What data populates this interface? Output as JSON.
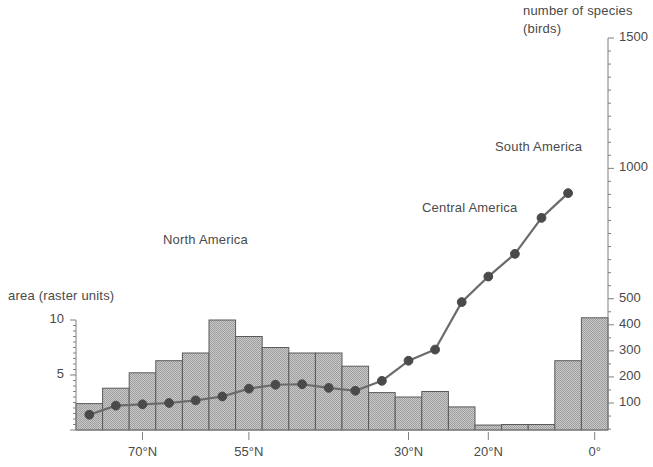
{
  "chart_data": {
    "type": "bar",
    "title": "",
    "subtitle": "",
    "xlabel": "",
    "ylabel": "area (raster units)",
    "y2label": "number of species (birds)",
    "grid": false,
    "legend_position": "inline-annotations",
    "x_tick_labels": [
      "70°N",
      "55°N",
      "30°N",
      "20°N",
      "0°"
    ],
    "x_tick_bins": [
      2,
      6,
      12,
      15,
      19
    ],
    "ylim": [
      0,
      11
    ],
    "y_ticks": [
      5,
      10
    ],
    "y2lim": [
      0,
      1500
    ],
    "y2_ticks": [
      100,
      200,
      300,
      400,
      500,
      1000,
      1500
    ],
    "categories": [
      "bin1",
      "bin2",
      "bin3",
      "bin4",
      "bin5",
      "bin6",
      "bin7",
      "bin8",
      "bin9",
      "bin10",
      "bin11",
      "bin12",
      "bin13",
      "bin14",
      "bin15",
      "bin16",
      "bin17",
      "bin18",
      "bin19",
      "bin20"
    ],
    "series": [
      {
        "name": "area (raster units)",
        "type": "bar",
        "axis": "left",
        "values": [
          2.4,
          3.8,
          5.2,
          6.3,
          7.0,
          10.0,
          8.5,
          7.5,
          7.0,
          7.0,
          5.8,
          3.4,
          3.0,
          3.5,
          2.1,
          0.45,
          0.5,
          0.5,
          6.3,
          10.2
        ]
      },
      {
        "name": "number of species (birds)",
        "type": "line",
        "axis": "right",
        "values": [
          55,
          90,
          95,
          100,
          110,
          125,
          155,
          170,
          172,
          158,
          147,
          185,
          262,
          305,
          487,
          585,
          672,
          810,
          905,
          null
        ]
      }
    ],
    "annotations": [
      {
        "text": "North America",
        "x_bin": 5,
        "note": "bar region label"
      },
      {
        "text": "Central America",
        "x_bin": 14,
        "note": "line region label"
      },
      {
        "text": "South America",
        "x_bin": 18,
        "note": "line region label"
      }
    ],
    "colors": {
      "bar_fill": "#b6b6b6",
      "bar_stroke": "#5a5a5a",
      "line": "#6b6b6b",
      "marker": "#4a4a4a",
      "axis": "#808080",
      "text": "#4a4a4a"
    }
  },
  "axes": {
    "left": {
      "title": "area (raster units)",
      "ticks": [
        {
          "value": 10,
          "label": "10"
        },
        {
          "value": 5,
          "label": "5"
        }
      ]
    },
    "right": {
      "title_line1": "number of species",
      "title_line2": "(birds)",
      "ticks": [
        {
          "value": 1500,
          "label": "1500"
        },
        {
          "value": 1000,
          "label": "1000"
        },
        {
          "value": 500,
          "label": "500"
        },
        {
          "value": 400,
          "label": "400"
        },
        {
          "value": 300,
          "label": "300"
        },
        {
          "value": 200,
          "label": "200"
        },
        {
          "value": 100,
          "label": "100"
        }
      ]
    },
    "bottom": {
      "ticks": [
        {
          "label": "70°N"
        },
        {
          "label": "55°N"
        },
        {
          "label": "30°N"
        },
        {
          "label": "20°N"
        },
        {
          "label": "0°"
        }
      ]
    }
  },
  "annotations": {
    "north_america": "North America",
    "central_america": "Central America",
    "south_america": "South America"
  }
}
